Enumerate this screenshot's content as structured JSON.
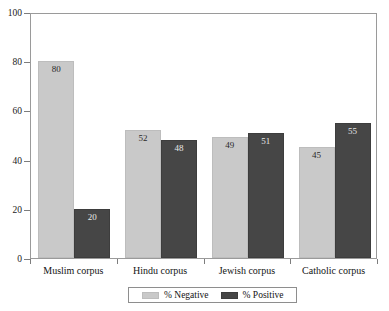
{
  "chart_data": {
    "type": "bar",
    "title": "",
    "subtitle": "",
    "xlabel": "",
    "ylabel": "",
    "ylim": [
      0,
      100
    ],
    "ytick_values": [
      0,
      20,
      40,
      60,
      80,
      100
    ],
    "ytick_labels": [
      "0",
      "20",
      "40",
      "60",
      "80",
      "100"
    ],
    "grid": false,
    "legend_position": "bottom",
    "categories": [
      "Muslim corpus",
      "Hindu corpus",
      "Jewish corpus",
      "Catholic corpus"
    ],
    "series": [
      {
        "name": "% Negative",
        "color": "#c9c9c9",
        "values": [
          80,
          52,
          49,
          45
        ],
        "labels": [
          "80",
          "52",
          "49",
          "45"
        ]
      },
      {
        "name": "% Positive",
        "color": "#464646",
        "values": [
          20,
          48,
          51,
          55
        ],
        "labels": [
          "20",
          "48",
          "51",
          "55"
        ]
      }
    ]
  },
  "axes": {
    "y_ticks": [
      {
        "label": "100",
        "value": 100
      },
      {
        "label": "80",
        "value": 80
      },
      {
        "label": "60",
        "value": 60
      },
      {
        "label": "40",
        "value": 40
      },
      {
        "label": "20",
        "value": 20
      },
      {
        "label": "0",
        "value": 0
      }
    ],
    "x_categories": [
      {
        "label": "Muslim corpus"
      },
      {
        "label": "Hindu corpus"
      },
      {
        "label": "Jewish corpus"
      },
      {
        "label": "Catholic corpus"
      }
    ]
  },
  "bars": [
    {
      "group": "Muslim corpus",
      "series": "% Negative",
      "value": 80,
      "label": "80"
    },
    {
      "group": "Muslim corpus",
      "series": "% Positive",
      "value": 20,
      "label": "20"
    },
    {
      "group": "Hindu corpus",
      "series": "% Negative",
      "value": 52,
      "label": "52"
    },
    {
      "group": "Hindu corpus",
      "series": "% Positive",
      "value": 48,
      "label": "48"
    },
    {
      "group": "Jewish corpus",
      "series": "% Negative",
      "value": 49,
      "label": "49"
    },
    {
      "group": "Jewish corpus",
      "series": "% Positive",
      "value": 51,
      "label": "51"
    },
    {
      "group": "Catholic corpus",
      "series": "% Negative",
      "value": 45,
      "label": "45"
    },
    {
      "group": "Catholic corpus",
      "series": "% Positive",
      "value": 55,
      "label": "55"
    }
  ],
  "legend": {
    "items": [
      {
        "label": "% Negative",
        "color": "#c9c9c9"
      },
      {
        "label": "% Positive",
        "color": "#464646"
      }
    ]
  },
  "colors": {
    "negative": "#c9c9c9",
    "positive": "#464646",
    "axis": "#8e8e8e",
    "background": "#ffffff",
    "text": "#141414"
  }
}
